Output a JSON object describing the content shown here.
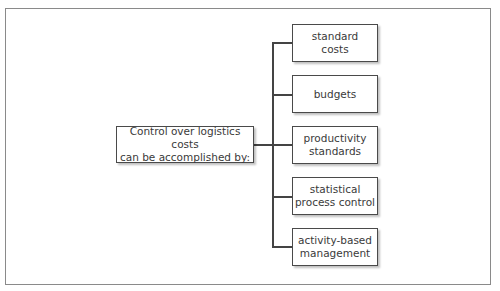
{
  "diagram": {
    "source": {
      "line1": "Control over logistics costs",
      "line2": "can be accomplished by:"
    },
    "targets": [
      {
        "line1": "standard",
        "line2": "costs"
      },
      {
        "line1": "budgets",
        "line2": ""
      },
      {
        "line1": "productivity",
        "line2": "standards"
      },
      {
        "line1": "statistical",
        "line2": "process control"
      },
      {
        "line1": "activity-based",
        "line2": "management"
      }
    ],
    "colors": {
      "line": "#444444",
      "border": "#4a4a4a",
      "frame": "#8a8a8a"
    }
  }
}
